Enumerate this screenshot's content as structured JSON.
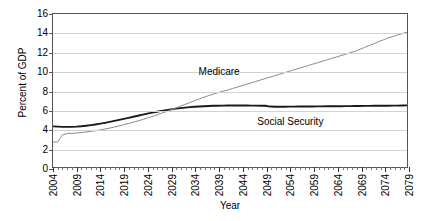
{
  "chart_data": {
    "type": "line",
    "title": "",
    "xlabel": "Year",
    "ylabel": "Percent of GDP",
    "xlim": [
      2004,
      2079
    ],
    "ylim": [
      0,
      16
    ],
    "yticks": [
      0,
      2,
      4,
      6,
      8,
      10,
      12,
      14,
      16
    ],
    "ytick_labels": [
      "0",
      "2",
      "4",
      "6",
      "8",
      "10",
      "12",
      "14",
      "16"
    ],
    "xticks": [
      2004,
      2009,
      2014,
      2019,
      2024,
      2029,
      2034,
      2039,
      2044,
      2049,
      2054,
      2059,
      2064,
      2069,
      2074,
      2079
    ],
    "xtick_labels": [
      "2004",
      "2009",
      "2014",
      "2019",
      "2024",
      "2029",
      "2034",
      "2039",
      "2044",
      "2049",
      "2054",
      "2059",
      "2064",
      "2069",
      "2074",
      "2079"
    ],
    "xtick_minor_step": 1,
    "grid": true,
    "grid_axis": "y",
    "legend": "none",
    "annotations": [
      {
        "text": "Medicare",
        "x": 2039,
        "y": 10.0
      },
      {
        "text": "Social Security",
        "x": 2054,
        "y": 4.9
      }
    ],
    "series": [
      {
        "name": "Social Security",
        "color": "#1a1a1a",
        "width": 1.9,
        "x": [
          2004,
          2005,
          2006,
          2007,
          2008,
          2009,
          2010,
          2011,
          2012,
          2013,
          2014,
          2015,
          2016,
          2017,
          2018,
          2019,
          2020,
          2021,
          2022,
          2023,
          2024,
          2025,
          2026,
          2027,
          2028,
          2029,
          2030,
          2031,
          2032,
          2033,
          2034,
          2035,
          2036,
          2037,
          2038,
          2039,
          2040,
          2041,
          2042,
          2043,
          2044,
          2045,
          2046,
          2047,
          2048,
          2049,
          2050,
          2051,
          2052,
          2053,
          2054,
          2055,
          2056,
          2057,
          2058,
          2059,
          2060,
          2061,
          2062,
          2063,
          2064,
          2065,
          2066,
          2067,
          2068,
          2069,
          2070,
          2071,
          2072,
          2073,
          2074,
          2075,
          2076,
          2077,
          2078,
          2079
        ],
        "values": [
          4.25,
          4.22,
          4.2,
          4.2,
          4.2,
          4.22,
          4.26,
          4.32,
          4.38,
          4.45,
          4.53,
          4.62,
          4.72,
          4.82,
          4.93,
          5.03,
          5.14,
          5.25,
          5.36,
          5.47,
          5.58,
          5.68,
          5.78,
          5.87,
          5.95,
          6.03,
          6.1,
          6.16,
          6.21,
          6.26,
          6.3,
          6.33,
          6.36,
          6.38,
          6.4,
          6.41,
          6.42,
          6.43,
          6.43,
          6.43,
          6.43,
          6.43,
          6.42,
          6.42,
          6.41,
          6.4,
          6.32,
          6.3,
          6.3,
          6.3,
          6.31,
          6.31,
          6.32,
          6.32,
          6.33,
          6.33,
          6.34,
          6.34,
          6.35,
          6.35,
          6.36,
          6.36,
          6.37,
          6.37,
          6.38,
          6.38,
          6.39,
          6.39,
          6.4,
          6.4,
          6.41,
          6.41,
          6.42,
          6.42,
          6.43,
          6.45
        ]
      },
      {
        "name": "Medicare",
        "color": "#8c8c8c",
        "width": 1.0,
        "x": [
          2004,
          2005,
          2006,
          2007,
          2008,
          2009,
          2010,
          2011,
          2012,
          2013,
          2014,
          2015,
          2016,
          2017,
          2018,
          2019,
          2020,
          2021,
          2022,
          2023,
          2024,
          2025,
          2026,
          2027,
          2028,
          2029,
          2030,
          2031,
          2032,
          2033,
          2034,
          2035,
          2036,
          2037,
          2038,
          2039,
          2040,
          2041,
          2042,
          2043,
          2044,
          2045,
          2046,
          2047,
          2048,
          2049,
          2050,
          2051,
          2052,
          2053,
          2054,
          2055,
          2056,
          2057,
          2058,
          2059,
          2060,
          2061,
          2062,
          2063,
          2064,
          2065,
          2066,
          2067,
          2068,
          2069,
          2070,
          2071,
          2072,
          2073,
          2074,
          2075,
          2076,
          2077,
          2078,
          2079
        ],
        "values": [
          2.6,
          2.62,
          3.35,
          3.5,
          3.52,
          3.55,
          3.6,
          3.66,
          3.73,
          3.8,
          3.88,
          3.97,
          4.07,
          4.18,
          4.3,
          4.42,
          4.55,
          4.68,
          4.82,
          4.97,
          5.12,
          5.28,
          5.45,
          5.62,
          5.8,
          5.98,
          6.17,
          6.36,
          6.55,
          6.74,
          6.93,
          7.12,
          7.3,
          7.47,
          7.63,
          7.78,
          7.92,
          8.05,
          8.2,
          8.35,
          8.5,
          8.65,
          8.8,
          8.95,
          9.1,
          9.25,
          9.4,
          9.55,
          9.7,
          9.85,
          10.0,
          10.15,
          10.3,
          10.45,
          10.6,
          10.75,
          10.9,
          11.05,
          11.2,
          11.35,
          11.5,
          11.65,
          11.8,
          11.95,
          12.1,
          12.3,
          12.5,
          12.7,
          12.9,
          13.1,
          13.3,
          13.5,
          13.65,
          13.8,
          13.95,
          14.1
        ]
      }
    ]
  }
}
